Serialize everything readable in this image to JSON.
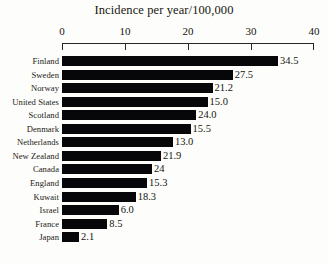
{
  "chart_data": {
    "type": "bar",
    "orientation": "horizontal",
    "title": "Incidence per year/100,000",
    "xlabel": "",
    "ylabel": "",
    "xlim": [
      0,
      40
    ],
    "xticks": [
      0,
      10,
      20,
      30,
      40
    ],
    "xtick_labels": [
      "0",
      "10",
      "20",
      "30",
      "40"
    ],
    "grid": false,
    "legend": null,
    "categories": [
      "Finland",
      "Sweden",
      "Norway",
      "United States",
      "Scotland",
      "Denmark",
      "Netherlands",
      "New Zealand",
      "Canada",
      "England",
      "Kuwait",
      "Israel",
      "France",
      "Japan"
    ],
    "values": [
      34.5,
      27.5,
      21.2,
      15.0,
      24.0,
      15.5,
      13.0,
      21.9,
      24,
      15.3,
      18.3,
      6.0,
      8.5,
      2.1
    ],
    "value_labels": [
      "34.5",
      "27.5",
      "21.2",
      "15.0",
      "24.0",
      "15.5",
      "13.0",
      "21.9",
      "24",
      "15.3",
      "18.3",
      "6.0",
      "8.5",
      "2.1"
    ],
    "bar_lengths_axis_units": [
      34.3,
      27.1,
      23.9,
      23.1,
      21.3,
      20.4,
      17.6,
      15.7,
      14.3,
      13.5,
      11.7,
      9.0,
      7.2,
      2.7
    ],
    "bar_color": "#07070a",
    "axis_color": "#2a2a25",
    "background_color": "#fdfdfc"
  },
  "caption": {
    "text": "  "
  }
}
